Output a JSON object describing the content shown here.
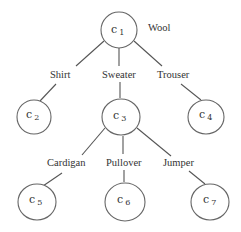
{
  "diagram": {
    "type": "tree",
    "root_label": "Wool",
    "nodes": [
      {
        "id": "c1",
        "base": "c",
        "sub": "1",
        "cx": 119,
        "cy": 30,
        "r": 18
      },
      {
        "id": "c2",
        "base": "c",
        "sub": "2",
        "cx": 34,
        "cy": 117,
        "r": 17
      },
      {
        "id": "c3",
        "base": "c",
        "sub": "3",
        "cx": 121,
        "cy": 117,
        "r": 19
      },
      {
        "id": "c4",
        "base": "c",
        "sub": "4",
        "cx": 206,
        "cy": 117,
        "r": 18
      },
      {
        "id": "c5",
        "base": "c",
        "sub": "5",
        "cx": 37,
        "cy": 202,
        "r": 18
      },
      {
        "id": "c6",
        "base": "c",
        "sub": "6",
        "cx": 125,
        "cy": 202,
        "r": 20
      },
      {
        "id": "c7",
        "base": "c",
        "sub": "7",
        "cx": 210,
        "cy": 202,
        "r": 19
      }
    ],
    "edges": [
      {
        "from": "c1",
        "to": "c2",
        "label": "Shirt",
        "lx": 62,
        "ly": 77
      },
      {
        "from": "c1",
        "to": "c3",
        "label": "Sweater",
        "lx": 120,
        "ly": 77
      },
      {
        "from": "c1",
        "to": "c4",
        "label": "Trouser",
        "lx": 174,
        "ly": 77
      },
      {
        "from": "c3",
        "to": "c5",
        "label": "Cardigan",
        "lx": 68,
        "ly": 165
      },
      {
        "from": "c3",
        "to": "c6",
        "label": "Pullover",
        "lx": 125,
        "ly": 165
      },
      {
        "from": "c3",
        "to": "c7",
        "label": "Jumper",
        "lx": 184,
        "ly": 165
      }
    ]
  }
}
